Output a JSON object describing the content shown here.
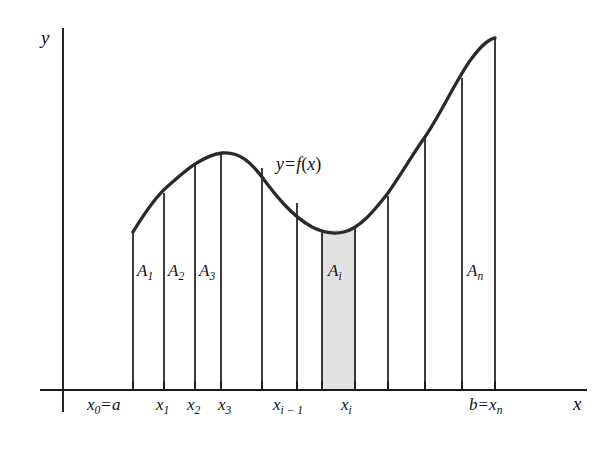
{
  "figure": {
    "background_color": "#ffffff",
    "ink_color": "#1a1a1a",
    "shade_color": "#e2e2e2"
  },
  "axes": {
    "y_axis_label": "y",
    "x_axis_label": "x",
    "x_axis_y_pixel": 390,
    "y_axis_x_pixel": 63,
    "x_axis_end_pixel": 587,
    "y_axis_top_pixel": 28
  },
  "curve": {
    "label_y": "y",
    "label_equals": "=",
    "label_f": "f",
    "label_paren_open": "(",
    "label_var": "x",
    "label_paren_close": ")",
    "full_label": "y = f(x)",
    "stroke_width": 3.2,
    "points": [
      [
        133,
        232
      ],
      [
        150,
        206
      ],
      [
        168,
        186
      ],
      [
        186,
        170
      ],
      [
        204,
        158
      ],
      [
        222,
        153
      ],
      [
        240,
        157
      ],
      [
        258,
        170
      ],
      [
        276,
        189
      ],
      [
        294,
        209
      ],
      [
        312,
        226
      ],
      [
        326,
        233
      ],
      [
        340,
        234
      ],
      [
        355,
        228
      ],
      [
        372,
        214
      ],
      [
        390,
        193
      ],
      [
        408,
        167
      ],
      [
        425,
        137
      ],
      [
        443,
        104
      ],
      [
        460,
        74
      ],
      [
        477,
        51
      ],
      [
        488,
        41
      ],
      [
        495,
        38
      ]
    ]
  },
  "partitions": {
    "x_pixels": [
      133,
      164,
      195,
      221,
      262,
      297,
      322,
      355,
      388,
      425,
      462,
      495
    ],
    "tops": [
      232,
      193,
      164,
      153,
      168,
      203,
      231,
      228,
      196,
      137,
      78,
      38
    ]
  },
  "shaded_strip": {
    "name": "A_i",
    "x_left": 322,
    "x_right": 355,
    "top_left": 231,
    "top_right": 228,
    "fill": "#e2e2e2"
  },
  "region_labels": [
    {
      "name": "A-1",
      "base": "A",
      "sub": "1",
      "x": 138,
      "y": 270
    },
    {
      "name": "A-2",
      "base": "A",
      "sub": "2",
      "x": 169,
      "y": 270
    },
    {
      "name": "A-3",
      "base": "A",
      "sub": "3",
      "x": 200,
      "y": 270
    },
    {
      "name": "A-i",
      "base": "A",
      "sub": "i",
      "x": 328,
      "y": 270
    },
    {
      "name": "A-n",
      "base": "A",
      "sub": "n",
      "x": 468,
      "y": 270
    }
  ],
  "tick_labels": [
    {
      "name": "x0-equals-a",
      "text": "x0 = a",
      "base": "x",
      "sub": "0",
      "eq": "=",
      "tail": "a",
      "x": 90,
      "y": 397
    },
    {
      "name": "x1",
      "text": "x1",
      "base": "x",
      "sub": "1",
      "eq": "",
      "tail": "",
      "x": 159,
      "y": 397
    },
    {
      "name": "x2",
      "text": "x2",
      "base": "x",
      "sub": "2",
      "eq": "",
      "tail": "",
      "x": 190,
      "y": 397
    },
    {
      "name": "x3",
      "text": "x3",
      "base": "x",
      "sub": "3",
      "eq": "",
      "tail": "",
      "x": 221,
      "y": 397
    },
    {
      "name": "xi-minus-1",
      "text": "xi-1",
      "base": "x",
      "sub": "i − 1",
      "eq": "",
      "tail": "",
      "x": 276,
      "y": 397
    },
    {
      "name": "xi",
      "text": "xi",
      "base": "x",
      "sub": "i",
      "eq": "",
      "tail": "",
      "x": 344,
      "y": 397
    },
    {
      "name": "b-equals-xn",
      "text": "b = xn",
      "base": "b",
      "sub": "n",
      "eq": "=",
      "tail": "x",
      "x": 472,
      "y": 397
    }
  ],
  "tick_marks": {
    "x_pixels": [
      133,
      164,
      195,
      221,
      262,
      297,
      322,
      355,
      388,
      425,
      462,
      495
    ],
    "length": 9
  }
}
